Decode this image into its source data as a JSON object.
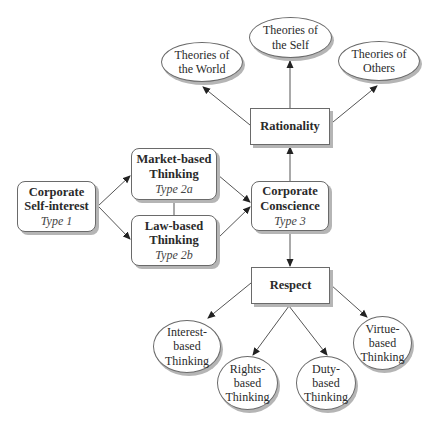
{
  "diagram": {
    "type_1": {
      "title_line1": "Corporate",
      "title_line2": "Self-interest",
      "type": "Type 1"
    },
    "type_2a": {
      "title_line1": "Market-based",
      "title_line2": "Thinking",
      "type": "Type 2a"
    },
    "type_2b": {
      "title_line1": "Law-based",
      "title_line2": "Thinking",
      "type": "Type 2b"
    },
    "type_3": {
      "title_line1": "Corporate",
      "title_line2": "Conscience",
      "type": "Type 3"
    },
    "rationality": {
      "label": "Rationality"
    },
    "respect": {
      "label": "Respect"
    },
    "rationality_children": [
      {
        "line1": "Theories of",
        "line2": "the World"
      },
      {
        "line1": "Theories of",
        "line2": "the Self"
      },
      {
        "line1": "Theories of",
        "line2": "Others"
      }
    ],
    "respect_children": [
      {
        "line1": "Interest-",
        "line2": "based",
        "line3": "Thinking"
      },
      {
        "line1": "Rights-",
        "line2": "based",
        "line3": "Thinking"
      },
      {
        "line1": "Duty-",
        "line2": "based",
        "line3": "Thinking"
      },
      {
        "line1": "Virtue-",
        "line2": "based",
        "line3": "Thinking"
      }
    ]
  },
  "colors": {
    "line": "#555555",
    "border": "#6a6a6a",
    "shadow": "#b5b5b5",
    "text": "#2a2a2a"
  }
}
